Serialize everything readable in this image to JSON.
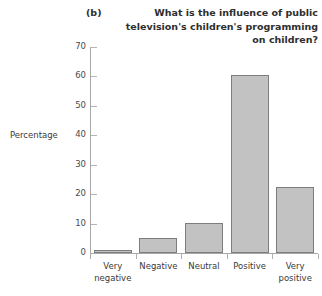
{
  "chart_data": {
    "type": "bar",
    "panel_letter": "(b)",
    "title": "What is the influence of public television's children's programming on children?",
    "categories": [
      "Very negative",
      "Negative",
      "Neutral",
      "Positive",
      "Very positive"
    ],
    "category_lines": [
      [
        "Very",
        "negative"
      ],
      [
        "Negative",
        ""
      ],
      [
        "Neutral",
        ""
      ],
      [
        "Positive",
        ""
      ],
      [
        "Very",
        "positive"
      ]
    ],
    "values": [
      1.0,
      5.0,
      10.3,
      60.5,
      22.5
    ],
    "xlabel": "",
    "ylabel": "Percentage",
    "ylim": [
      0,
      70
    ],
    "yticks": [
      0,
      10,
      20,
      30,
      40,
      50,
      60,
      70
    ],
    "ytick_labels": [
      "0",
      "10",
      "20",
      "30",
      "40",
      "50",
      "60",
      "70"
    ],
    "grid": false,
    "legend": null,
    "bar_fill_color": "#c2c2c2",
    "bar_border_color": "#7d7d7d",
    "axis_color": "#a8a8a8",
    "text_color": "#3a3a3a"
  }
}
